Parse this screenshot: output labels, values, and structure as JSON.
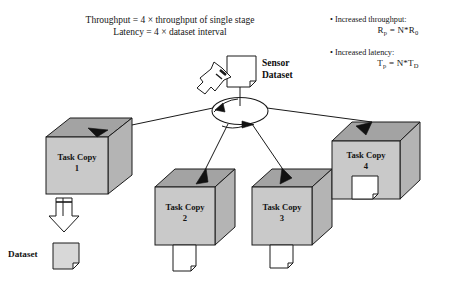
{
  "diagram": {
    "title_lines": [
      "Throughput = 4 × throughput of single stage",
      "Latency = 4 × dataset interval"
    ],
    "source": {
      "label_line1": "Sensor",
      "label_line2": "Dataset"
    },
    "notes": [
      {
        "bullet": "• Increased throughput:",
        "formula_main": "R",
        "formula_sub": "p",
        "formula_rest": " = N*R",
        "formula_sub2": "0"
      },
      {
        "bullet": "• Increased latency:",
        "formula_main": "T",
        "formula_sub": "p",
        "formula_rest": " = N*T",
        "formula_sub2": "D"
      }
    ],
    "nodes": [
      {
        "name": "task-copy-1",
        "line1": "Task Copy",
        "line2": "1"
      },
      {
        "name": "task-copy-2",
        "line1": "Task Copy",
        "line2": "2"
      },
      {
        "name": "task-copy-3",
        "line1": "Task Copy",
        "line2": "3"
      },
      {
        "name": "task-copy-4",
        "line1": "Task Copy",
        "line2": "4"
      }
    ],
    "legend": {
      "dataset_label": "Dataset"
    },
    "colors": {
      "cube_front": "#c9c9c9",
      "cube_top": "#a3a3a3",
      "cube_side": "#b4b4b4",
      "card_fill": "#d8d8d8",
      "card_white": "#ffffff",
      "stroke": "#1a1a1a",
      "background": "#ffffff"
    }
  }
}
